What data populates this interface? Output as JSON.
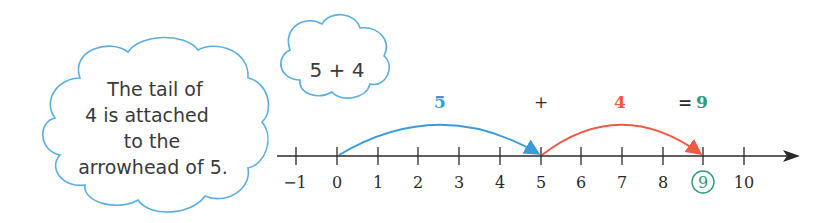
{
  "cloud_note": {
    "lines": [
      "The tail of",
      "4 is attached",
      "to the",
      "arrowhead of 5."
    ]
  },
  "cloud_expression": {
    "text": "5 + 4"
  },
  "equation": {
    "first_addend": "5",
    "plus": "+",
    "second_addend": "4",
    "equals": "=",
    "result": "9"
  },
  "number_line": {
    "ticks": [
      "−1",
      "0",
      "1",
      "2",
      "3",
      "4",
      "5",
      "6",
      "7",
      "8",
      "9",
      "10"
    ],
    "circled_value": "9",
    "jumps": [
      {
        "from": 0,
        "to": 5,
        "label": "5",
        "color": "#3b9ad9"
      },
      {
        "from": 5,
        "to": 9,
        "label": "4",
        "color": "#ee5a45"
      }
    ]
  },
  "colors": {
    "cloud_outline": "#5aaee0",
    "blue_arc": "#3b9ad9",
    "red_arc": "#ee5a45",
    "result_green": "#2e9b7e",
    "axis": "#2a2a2a"
  }
}
